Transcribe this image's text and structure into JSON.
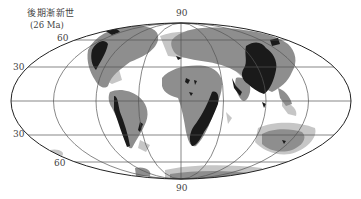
{
  "map": {
    "title": "後期漸新世",
    "subtitle": "(26 Ma)",
    "projection": "Mollweide",
    "labels": {
      "top": "90",
      "bottom": "90",
      "lat_60_north": "60",
      "lat_30_north": "30",
      "lat_30_south": "30",
      "lat_60_south": "60"
    },
    "legend_shades": {
      "highland": "#1a1a1a",
      "lowland": "#8e8e8e",
      "shelf": "#c6c6c6",
      "ocean": "#ffffff"
    }
  }
}
